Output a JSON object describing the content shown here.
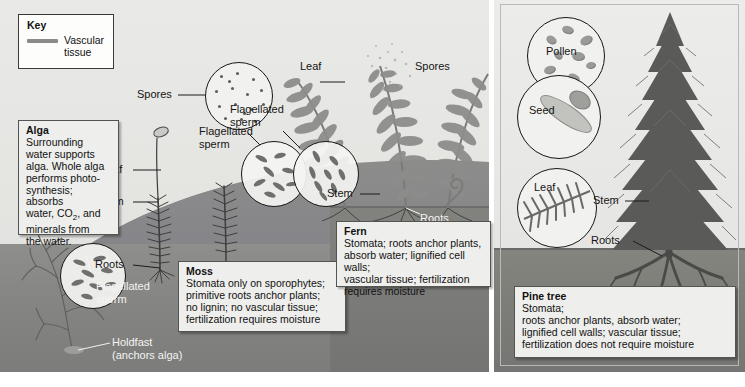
{
  "figure": {
    "panels": [
      "alga-moss-fern",
      "pine-tree"
    ]
  },
  "key": {
    "title": "Key",
    "swatch_label": "Vascular\ntissue",
    "swatch_color": "#8a8a88"
  },
  "boxes": {
    "alga": {
      "title": "Alga",
      "body": "Surrounding\nwater supports\nalga. Whole alga\nperforms photo-\nsynthesis; absorbs\nwater, CO2, and\nminerals from\nthe water."
    },
    "moss": {
      "title": "Moss",
      "body": "Stomata only on sporophytes;\nprimitive roots anchor plants;\nno lignin;  no vascular tissue;\nfertilization requires moisture"
    },
    "fern": {
      "title": "Fern",
      "body": "Stomata;  roots anchor plants,\nabsorb water;  lignified cell walls;\nvascular tissue;  fertilization\nrequires moisture"
    },
    "pine": {
      "title": "Pine tree",
      "body": "Stomata;\nroots anchor plants, absorb water;\nlignified cell walls;  vascular tissue;\nfertilization does not require moisture"
    }
  },
  "labels": {
    "alga_flagellated_sperm": "Flagellated\nsperm",
    "alga_holdfast": "Holdfast\n(anchors alga)",
    "moss_spores": "Spores",
    "moss_flagellated_sperm": "Flagellated\nsperm",
    "moss_leaf": "Leaf",
    "moss_stem": "Stem",
    "moss_roots": "Roots",
    "fern_leaf": "Leaf",
    "fern_spores": "Spores",
    "fern_flagellated_sperm": "Flagellated\nsperm",
    "fern_stem": "Stem",
    "fern_roots": "Roots",
    "pine_pollen": "Pollen",
    "pine_seed": "Seed",
    "pine_leaf": "Leaf",
    "pine_stem": "Stem",
    "pine_roots": "Roots"
  },
  "colors": {
    "panel_background": "#e6e6e4",
    "water": "#84847f",
    "soil": "#7a7a78",
    "text": "#151515",
    "light_text": "#f4f4f2",
    "box_fill": "#eeeeec",
    "box_border": "#55554f"
  }
}
